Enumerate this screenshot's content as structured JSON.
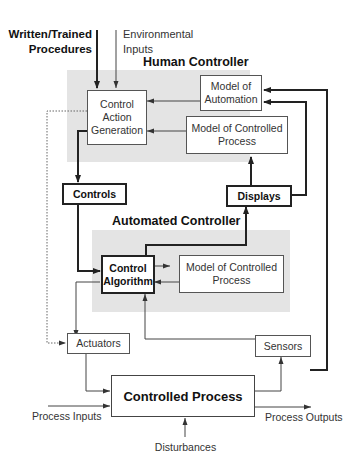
{
  "inputs": {
    "procedures": "Written/Trained Procedures",
    "environmental": "Environmental Inputs"
  },
  "human_controller": {
    "title": "Human Controller",
    "control_action_generation": "Control Action Generation",
    "model_of_automation": "Model of Automation",
    "model_of_controlled_process": "Model of Controlled Process"
  },
  "controls": "Controls",
  "displays": "Displays",
  "automated_controller": {
    "title": "Automated Controller",
    "control_algorithm": "Control Algorithm",
    "model_of_controlled_process": "Model of Controlled Process"
  },
  "actuators": "Actuators",
  "sensors": "Sensors",
  "controlled_process": "Controlled Process",
  "process_inputs": "Process Inputs",
  "process_outputs": "Process Outputs",
  "disturbances": "Disturbances",
  "colors": {
    "region_fill": "#e4e4e4",
    "line": "#222222"
  }
}
